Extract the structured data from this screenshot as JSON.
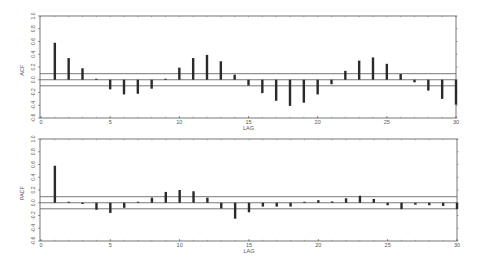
{
  "chart_data": [
    {
      "type": "bar",
      "title": "",
      "xlabel": "LAG",
      "ylabel": "ACF",
      "xlim": [
        0,
        30
      ],
      "ylim": [
        -0.6,
        1.0
      ],
      "xticks": [
        "0",
        "5",
        "10",
        "15",
        "20",
        "25",
        "30"
      ],
      "yticks": [
        "1.0",
        "0.8",
        "0.6",
        "0.4",
        "0.2",
        "0.0",
        "-0.2",
        "-0.4",
        "-0.6"
      ],
      "confidence_band": 0.095,
      "grid": false,
      "legend": null,
      "categories": [
        1,
        2,
        3,
        4,
        5,
        6,
        7,
        8,
        9,
        10,
        11,
        12,
        13,
        14,
        15,
        16,
        17,
        18,
        19,
        20,
        21,
        22,
        23,
        24,
        25,
        26,
        27,
        28,
        29,
        30
      ],
      "values": [
        0.58,
        0.34,
        0.18,
        0.01,
        -0.15,
        -0.23,
        -0.22,
        -0.14,
        0.0,
        0.19,
        0.34,
        0.39,
        0.29,
        0.08,
        -0.09,
        -0.21,
        -0.33,
        -0.41,
        -0.36,
        -0.23,
        -0.07,
        0.14,
        0.3,
        0.35,
        0.25,
        0.09,
        -0.04,
        -0.17,
        -0.3,
        -0.39
      ]
    },
    {
      "type": "bar",
      "title": "",
      "xlabel": "LAG",
      "ylabel": "PACF",
      "xlim": [
        0,
        30
      ],
      "ylim": [
        -0.6,
        1.0
      ],
      "xticks": [
        "0",
        "5",
        "10",
        "15",
        "20",
        "25",
        "30"
      ],
      "yticks": [
        "1.0",
        "0.8",
        "0.6",
        "0.4",
        "0.2",
        "0.0",
        "-0.2",
        "-0.4",
        "-0.6"
      ],
      "confidence_band": 0.095,
      "grid": false,
      "legend": null,
      "categories": [
        1,
        2,
        3,
        4,
        5,
        6,
        7,
        8,
        9,
        10,
        11,
        12,
        13,
        14,
        15,
        16,
        17,
        18,
        19,
        20,
        21,
        22,
        23,
        24,
        25,
        26,
        27,
        28,
        29,
        30
      ],
      "values": [
        0.58,
        0.0,
        -0.02,
        -0.11,
        -0.16,
        -0.08,
        0.0,
        0.08,
        0.17,
        0.2,
        0.18,
        0.08,
        -0.09,
        -0.25,
        -0.15,
        -0.06,
        -0.06,
        -0.06,
        0.0,
        0.04,
        0.02,
        0.07,
        0.11,
        0.06,
        -0.04,
        -0.1,
        -0.03,
        -0.04,
        -0.05,
        -0.1
      ]
    }
  ],
  "style": {
    "bar_color": "#2a2a2a",
    "frame_color": "#555555",
    "band_color": "#555555"
  }
}
